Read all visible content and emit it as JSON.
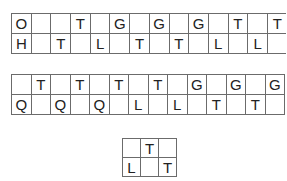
{
  "puzzles": [
    {
      "id": "grid1",
      "rows": [
        [
          "O",
          "",
          "",
          "T",
          "",
          "G",
          "",
          "G",
          "",
          "G",
          "",
          "T",
          "",
          "T"
        ],
        [
          "H",
          "",
          "T",
          "",
          "L",
          "",
          "T",
          "",
          "T",
          "",
          "L",
          "",
          "L",
          ""
        ]
      ]
    },
    {
      "id": "grid2",
      "rows": [
        [
          "",
          "T",
          "",
          "T",
          "",
          "T",
          "",
          "T",
          "",
          "G",
          "",
          "G",
          "",
          "G"
        ],
        [
          "Q",
          "",
          "Q",
          "",
          "Q",
          "",
          "L",
          "",
          "L",
          "",
          "T",
          "",
          "T",
          ""
        ]
      ]
    },
    {
      "id": "grid3",
      "rows": [
        [
          "",
          "T",
          ""
        ],
        [
          "L",
          "",
          "T"
        ]
      ]
    }
  ],
  "colors": {
    "grid_line": "#6b6b6b",
    "letter": "#222222",
    "background": "#ffffff"
  }
}
